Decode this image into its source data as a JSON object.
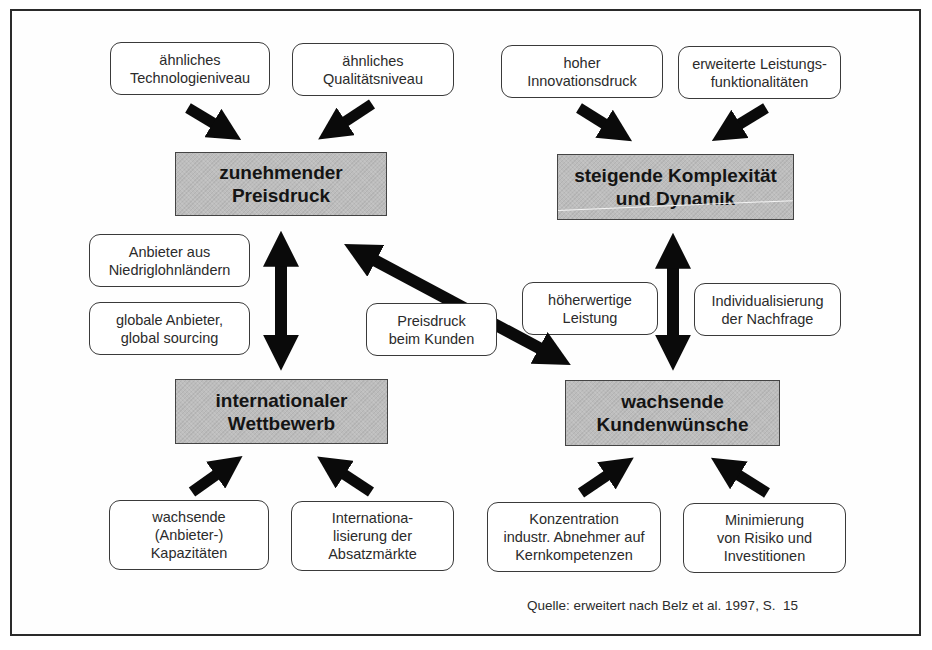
{
  "diagram": {
    "core_factors": {
      "top_left": "zunehmender\nPreisdruck",
      "top_right": "steigende Komplexität\nund Dynamik",
      "bottom_left": "internationaler\nWettbewerb",
      "bottom_right": "wachsende\nKundenwünsche"
    },
    "drivers": {
      "technology_level": "ähnliches\nTechnologieniveau",
      "quality_level": "ähnliches\nQualitätsniveau",
      "innovation_pressure": "hoher\nInnovationsdruck",
      "extended_functionality": "erweiterte Leistungs-\nfunktionalitäten",
      "low_wage_suppliers": "Anbieter aus\nNiedriglohnländern",
      "global_sourcing": "globale Anbieter,\nglobal sourcing",
      "customer_price_pressure": "Preisdruck\nbeim Kunden",
      "higher_value_service": "höherwertige\nLeistung",
      "individualization": "Individualisierung\nder Nachfrage",
      "growing_capacities": "wachsende\n(Anbieter-)\nKapazitäten",
      "internationalization": "Internationa-\nlisierung der\nAbsatzmärkte",
      "core_competence_focus": "Konzentration\nindustr. Abnehmer auf\nKernkompetenzen",
      "risk_minimization": "Minimierung\nvon Risiko und\nInvestitionen"
    },
    "source": "Quelle: erweitert nach Belz et al. 1997, S.  15"
  },
  "colors": {
    "frame": "#2a2a2a",
    "core_fill": "#bdbdbd",
    "arrow": "#0a0a0a",
    "node_border": "#3a3a3a"
  }
}
